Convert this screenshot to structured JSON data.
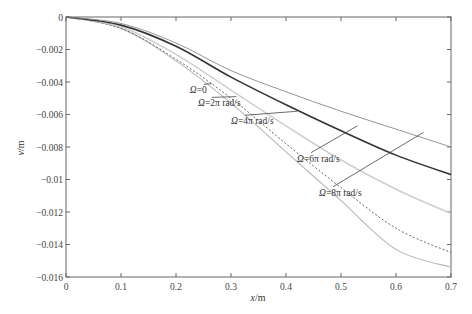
{
  "caption_fragment": "（cut-off Chinese text at top edge）",
  "chart_data": {
    "type": "line",
    "title": "",
    "xlabel": "x/m",
    "ylabel": "v/m",
    "xlim": [
      0,
      0.7
    ],
    "ylim": [
      -0.016,
      0
    ],
    "x_ticks": [
      "0",
      "0.1",
      "0.2",
      "0.3",
      "0.4",
      "0.5",
      "0.6",
      "0.7"
    ],
    "y_ticks": [
      "0",
      "-0.002",
      "-0.004",
      "-0.006",
      "-0.008",
      "-0.01",
      "-0.012",
      "-0.014",
      "-0.016"
    ],
    "grid": false,
    "legend": "inline annotations with leader lines",
    "x": [
      0,
      0.1,
      0.2,
      0.3,
      0.4,
      0.5,
      0.6,
      0.7
    ],
    "series": [
      {
        "name": "Ω=0",
        "style": "solid-lightgray",
        "values": [
          0,
          -0.0007,
          -0.0027,
          -0.0053,
          -0.0083,
          -0.0113,
          -0.0143,
          -0.0154
        ]
      },
      {
        "name": "Ω=2π rad/s",
        "style": "dotted",
        "values": [
          0,
          -0.0007,
          -0.0026,
          -0.005,
          -0.0078,
          -0.0105,
          -0.013,
          -0.0145
        ]
      },
      {
        "name": "Ω=4π rad/s",
        "style": "solid-gray",
        "values": [
          0,
          -0.0006,
          -0.0023,
          -0.0045,
          -0.0067,
          -0.0088,
          -0.0106,
          -0.0121
        ]
      },
      {
        "name": "Ω=6π rad/s",
        "style": "solid-black-thick",
        "values": [
          0,
          -0.0005,
          -0.0018,
          -0.0037,
          -0.0054,
          -0.007,
          -0.0085,
          -0.0097
        ]
      },
      {
        "name": "Ω=8π rad/s",
        "style": "solid-thin",
        "values": [
          0,
          -0.0004,
          -0.0016,
          -0.0033,
          -0.0046,
          -0.0058,
          -0.0069,
          -0.008
        ]
      }
    ],
    "annotations": [
      {
        "text": "Ω=0",
        "label_x": 0.225,
        "label_y": -0.0047,
        "points_to_x": 0.265,
        "points_to_y": -0.0041
      },
      {
        "text": "Ω=2π rad/s",
        "label_x": 0.24,
        "label_y": -0.0055,
        "points_to_x": 0.31,
        "points_to_y": -0.0049
      },
      {
        "text": "Ω=4π rad/s",
        "label_x": 0.3,
        "label_y": -0.0066,
        "points_to_x": 0.42,
        "points_to_y": -0.0058
      },
      {
        "text": "Ω=6π rad/s",
        "label_x": 0.42,
        "label_y": -0.0089,
        "points_to_x": 0.53,
        "points_to_y": -0.0067
      },
      {
        "text": "Ω=8π rad/s",
        "label_x": 0.46,
        "label_y": -0.011,
        "points_to_x": 0.65,
        "points_to_y": -0.0071
      }
    ]
  }
}
